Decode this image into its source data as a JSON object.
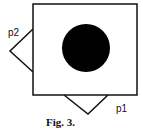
{
  "figure": {
    "caption": "Fig. 3.",
    "labels": {
      "p1": "p1",
      "p2": "p2"
    }
  }
}
